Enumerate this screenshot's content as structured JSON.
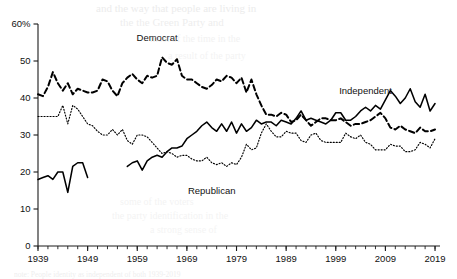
{
  "figure": {
    "background_color": "#ffffff",
    "ink_color": "#000000"
  },
  "bleed_through": {
    "note": "faint mirrored text showing through from the reverse side of the scanned page",
    "lines": [
      {
        "text": "and the way that people are living in",
        "x": 96,
        "y": 2,
        "size": 11,
        "opacity": 0.5
      },
      {
        "text": "the the Green Party and",
        "x": 120,
        "y": 16,
        "size": 11,
        "opacity": 0.45
      },
      {
        "text": "most of the time in the",
        "x": 150,
        "y": 33,
        "size": 10,
        "opacity": 0.35
      },
      {
        "text": "a result of the party",
        "x": 168,
        "y": 50,
        "size": 10,
        "opacity": 0.3
      },
      {
        "text": "some of the voters",
        "x": 120,
        "y": 196,
        "size": 10,
        "opacity": 0.3
      },
      {
        "text": "the party identification in the",
        "x": 112,
        "y": 210,
        "size": 10,
        "opacity": 0.3
      },
      {
        "text": "a strong sense of",
        "x": 150,
        "y": 224,
        "size": 10,
        "opacity": 0.28
      },
      {
        "text": "note: People identity as independent of both 1939-2019",
        "x": 14,
        "y": 270,
        "size": 7.5,
        "opacity": 0.45
      }
    ]
  },
  "chart_data": {
    "type": "line",
    "title": "",
    "subtitle": "",
    "xlabel": "",
    "ylabel": "",
    "xlim": [
      1939,
      2020
    ],
    "ylim": [
      0,
      60
    ],
    "grid": false,
    "legend": "inline-labels",
    "y_tick_values": [
      0,
      10,
      20,
      30,
      40,
      50,
      60
    ],
    "y_tick_labels": [
      "0",
      "10",
      "20",
      "30",
      "40",
      "50",
      "60%"
    ],
    "x_tick_values": [
      1939,
      1949,
      1959,
      1969,
      1979,
      1989,
      1999,
      2009,
      2019
    ],
    "x_tick_labels": [
      "1939",
      "1949",
      "1959",
      "1969",
      "1979",
      "1989",
      "1999",
      "2009",
      "2019"
    ],
    "x_minor_tick_interval": 2,
    "series": [
      {
        "name": "Democrat",
        "style": "dashed",
        "label_x": 1963,
        "label_y": 55.5,
        "segments": [
          {
            "x": [
              1939,
              1940,
              1941,
              1942,
              1943,
              1944,
              1945,
              1946,
              1947,
              1948,
              1949,
              1950,
              1951,
              1952,
              1953,
              1954,
              1955,
              1956,
              1957,
              1958,
              1959,
              1960,
              1961,
              1962,
              1963,
              1964,
              1965,
              1966,
              1967,
              1968,
              1969,
              1970,
              1971,
              1972,
              1973,
              1974,
              1975,
              1976,
              1977,
              1978,
              1979,
              1980,
              1981,
              1982,
              1983,
              1984,
              1985,
              1986,
              1987,
              1988,
              1989,
              1990,
              1991,
              1992,
              1993,
              1994,
              1995,
              1996,
              1997,
              1998,
              1999,
              2000,
              2001,
              2002,
              2003,
              2004,
              2005,
              2006,
              2007,
              2008,
              2009,
              2010,
              2011,
              2012,
              2013,
              2014,
              2015,
              2016,
              2017,
              2018,
              2019
            ],
            "y": [
              41.0,
              40.5,
              43.0,
              47.0,
              44.0,
              42.0,
              44.0,
              41.0,
              42.5,
              42.0,
              41.5,
              41.5,
              42.0,
              45.0,
              44.5,
              42.0,
              40.5,
              44.0,
              45.5,
              46.5,
              45.0,
              44.0,
              46.0,
              45.5,
              46.0,
              51.0,
              49.5,
              49.0,
              50.5,
              46.0,
              45.0,
              45.0,
              44.0,
              43.0,
              42.5,
              43.5,
              45.0,
              44.5,
              46.0,
              45.5,
              44.0,
              45.5,
              41.5,
              45.0,
              41.0,
              38.0,
              35.5,
              35.5,
              35.0,
              36.0,
              35.5,
              33.5,
              34.0,
              35.5,
              34.0,
              32.5,
              33.5,
              34.5,
              34.5,
              34.0,
              34.0,
              34.5,
              33.5,
              32.5,
              33.0,
              33.0,
              33.5,
              34.0,
              35.0,
              36.0,
              34.5,
              32.0,
              31.5,
              32.5,
              31.5,
              31.0,
              30.5,
              32.0,
              31.0,
              31.0,
              31.5
            ]
          }
        ]
      },
      {
        "name": "Republican",
        "style": "dotted",
        "label_x": 1974,
        "label_y": 14.0,
        "segments": [
          {
            "x": [
              1939,
              1940,
              1941,
              1942,
              1943,
              1944,
              1945,
              1946,
              1947,
              1948,
              1949,
              1950,
              1951,
              1952,
              1953,
              1954,
              1955,
              1956,
              1957,
              1958,
              1959,
              1960,
              1961,
              1962,
              1963,
              1964,
              1965,
              1966,
              1967,
              1968,
              1969,
              1970,
              1971,
              1972,
              1973,
              1974,
              1975,
              1976,
              1977,
              1978,
              1979,
              1980,
              1981,
              1982,
              1983,
              1984,
              1985,
              1986,
              1987,
              1988,
              1989,
              1990,
              1991,
              1992,
              1993,
              1994,
              1995,
              1996,
              1997,
              1998,
              1999,
              2000,
              2001,
              2002,
              2003,
              2004,
              2005,
              2006,
              2007,
              2008,
              2009,
              2010,
              2011,
              2012,
              2013,
              2014,
              2015,
              2016,
              2017,
              2018,
              2019
            ],
            "y": [
              35.0,
              35.0,
              35.0,
              35.0,
              35.0,
              38.0,
              33.0,
              38.0,
              37.0,
              35.0,
              33.0,
              32.5,
              31.0,
              30.0,
              30.0,
              31.5,
              30.0,
              31.5,
              28.5,
              27.5,
              30.0,
              30.0,
              29.5,
              28.0,
              26.5,
              25.0,
              25.5,
              25.0,
              24.0,
              24.5,
              24.5,
              23.5,
              23.0,
              23.0,
              24.0,
              22.5,
              22.0,
              22.5,
              21.5,
              22.5,
              22.0,
              24.0,
              27.5,
              26.0,
              26.5,
              30.5,
              33.0,
              31.0,
              29.5,
              29.5,
              31.0,
              30.5,
              30.5,
              28.5,
              28.0,
              30.0,
              30.5,
              28.5,
              28.0,
              28.0,
              28.0,
              28.0,
              30.5,
              29.5,
              29.0,
              30.0,
              28.0,
              27.5,
              26.0,
              26.0,
              26.0,
              27.5,
              27.0,
              27.0,
              25.5,
              25.5,
              26.0,
              28.0,
              27.5,
              26.5,
              29.0
            ]
          }
        ]
      },
      {
        "name": "Independent",
        "style": "solid",
        "label_x": 2005,
        "label_y": 41.0,
        "segments": [
          {
            "x": [
              1939,
              1940,
              1941,
              1942,
              1943,
              1944,
              1945,
              1946,
              1947,
              1948,
              1949
            ],
            "y": [
              18.0,
              18.5,
              19.0,
              18.0,
              20.0,
              20.0,
              14.5,
              21.5,
              22.5,
              22.5,
              18.5
            ]
          },
          {
            "x": [
              1957,
              1958,
              1959,
              1960,
              1961,
              1962,
              1963,
              1964,
              1965,
              1966,
              1967,
              1968,
              1969,
              1970,
              1971,
              1972,
              1973,
              1974,
              1975,
              1976,
              1977,
              1978,
              1979,
              1980,
              1981,
              1982,
              1983,
              1984,
              1985,
              1986,
              1987,
              1988,
              1989,
              1990,
              1991,
              1992,
              1993,
              1994,
              1995,
              1996,
              1997,
              1998,
              1999,
              2000,
              2001,
              2002,
              2003,
              2004,
              2005,
              2006,
              2007,
              2008,
              2009,
              2010,
              2011,
              2012,
              2013,
              2014,
              2015,
              2016,
              2017,
              2018,
              2019
            ],
            "y": [
              21.5,
              22.5,
              23.0,
              20.5,
              23.0,
              24.0,
              24.5,
              24.0,
              25.5,
              26.5,
              26.5,
              27.0,
              29.0,
              30.0,
              31.0,
              32.5,
              33.5,
              32.0,
              31.0,
              33.0,
              31.0,
              33.5,
              30.5,
              33.0,
              31.0,
              32.0,
              34.0,
              33.0,
              33.5,
              33.5,
              32.5,
              34.0,
              33.5,
              33.0,
              34.5,
              36.5,
              34.0,
              34.5,
              34.0,
              33.5,
              33.0,
              34.0,
              36.0,
              36.0,
              34.0,
              34.0,
              35.0,
              36.5,
              37.5,
              36.5,
              38.0,
              37.0,
              39.5,
              42.0,
              40.5,
              38.5,
              40.0,
              42.5,
              39.0,
              37.5,
              41.0,
              36.5,
              38.5
            ]
          }
        ]
      }
    ]
  }
}
